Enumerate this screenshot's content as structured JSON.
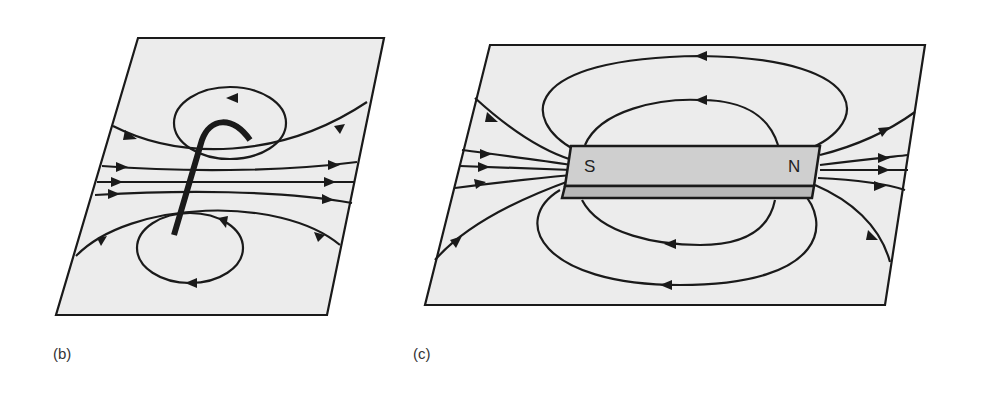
{
  "figure": {
    "panels": [
      {
        "id": "b",
        "label": "(b)",
        "subject": "current-carrying loop wire field lines"
      },
      {
        "id": "c",
        "label": "(c)",
        "subject": "bar magnet field lines",
        "poles": {
          "left": "S",
          "right": "N"
        }
      }
    ]
  },
  "colors": {
    "line": "#1a1a1a",
    "plane": "#ececec",
    "magnet": "#cfcfcf"
  }
}
